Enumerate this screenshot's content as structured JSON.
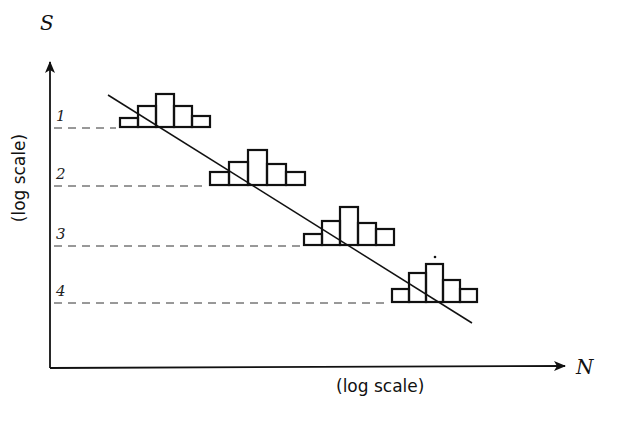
{
  "diagram": {
    "y_axis": {
      "symbol": "S",
      "scale_note": "(log scale)"
    },
    "x_axis": {
      "symbol": "N",
      "scale_note": "(log scale)"
    },
    "levels": [
      {
        "label": "1",
        "y": 127,
        "hist_left": 120,
        "bars": [
          9,
          21,
          33,
          21,
          11
        ],
        "bar_width": 18
      },
      {
        "label": "2",
        "y": 185,
        "hist_left": 210,
        "bars": [
          13,
          23,
          35,
          21,
          13
        ],
        "bar_width": 19
      },
      {
        "label": "3",
        "y": 245,
        "hist_left": 304,
        "bars": [
          11,
          24,
          38,
          22,
          16
        ],
        "bar_width": 18
      },
      {
        "label": "4",
        "y": 302,
        "hist_left": 392,
        "bars": [
          13,
          29,
          38,
          22,
          13
        ],
        "bar_width": 17
      }
    ],
    "trend_line": {
      "x1": 108,
      "y1": 95,
      "x2": 472,
      "y2": 323
    },
    "marker_dot": {
      "x": 435,
      "y": 257
    },
    "stroke_color": "#111111"
  }
}
